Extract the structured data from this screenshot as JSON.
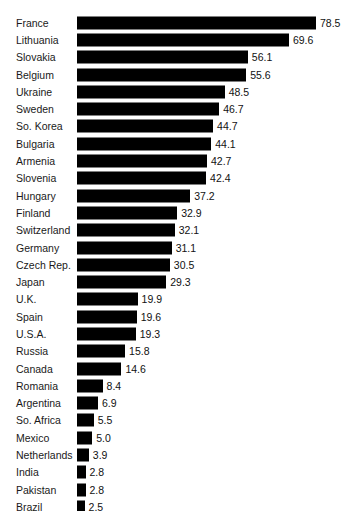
{
  "title_fragment": "",
  "colors": {
    "bar": "#000000",
    "background": "#ffffff",
    "label_text": "#1a1a1a",
    "value_text": "#111111"
  },
  "chart_data": {
    "type": "bar",
    "orientation": "horizontal",
    "title": "",
    "xlabel": "",
    "ylabel": "",
    "grid": false,
    "legend": false,
    "xlim": [
      0,
      78.5
    ],
    "categories": [
      "France",
      "Lithuania",
      "Slovakia",
      "Belgium",
      "Ukraine",
      "Sweden",
      "So. Korea",
      "Bulgaria",
      "Armenia",
      "Slovenia",
      "Hungary",
      "Finland",
      "Switzerland",
      "Germany",
      "Czech Rep.",
      "Japan",
      "U.K.",
      "Spain",
      "U.S.A.",
      "Russia",
      "Canada",
      "Romania",
      "Argentina",
      "So. Africa",
      "Mexico",
      "Netherlands",
      "India",
      "Pakistan",
      "Brazil",
      "China"
    ],
    "values": [
      78.5,
      69.6,
      56.1,
      55.6,
      48.5,
      46.7,
      44.7,
      44.1,
      42.7,
      42.4,
      37.2,
      32.9,
      32.1,
      31.1,
      30.5,
      29.3,
      19.9,
      19.6,
      19.3,
      15.8,
      14.6,
      8.4,
      6.9,
      5.5,
      5.0,
      3.9,
      2.8,
      2.8,
      2.5,
      2.0
    ],
    "value_labels": [
      "78.5",
      "69.6",
      "56.1",
      "55.6",
      "48.5",
      "46.7",
      "44.7",
      "44.1",
      "42.7",
      "42.4",
      "37.2",
      "32.9",
      "32.1",
      "31.1",
      "30.5",
      "29.3",
      "19.9",
      "19.6",
      "19.3",
      "15.8",
      "14.6",
      "8.4",
      "6.9",
      "5.5",
      "5.0",
      "3.9",
      "2.8",
      "2.8",
      "2.5",
      "2.0"
    ]
  }
}
